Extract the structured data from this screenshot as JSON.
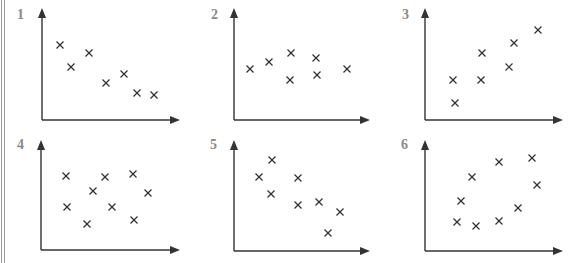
{
  "figure": {
    "axis_color": "#333333",
    "marker_color": "#333333",
    "label_color": "#8a8a8a",
    "border_color": "#9a9a9a"
  },
  "panels": [
    {
      "label": "1",
      "label_pos": [
        17,
        20
      ],
      "origin": [
        42,
        120
      ],
      "x_end": 180,
      "y_top": 8,
      "points": [
        [
          60,
          45
        ],
        [
          71,
          67
        ],
        [
          89,
          53
        ],
        [
          106,
          83
        ],
        [
          124,
          74
        ],
        [
          137,
          93
        ],
        [
          154,
          95
        ]
      ]
    },
    {
      "label": "2",
      "label_pos": [
        211,
        20
      ],
      "origin": [
        234,
        120
      ],
      "x_end": 370,
      "y_top": 8,
      "points": [
        [
          250,
          69
        ],
        [
          269,
          62
        ],
        [
          291,
          53
        ],
        [
          290,
          80
        ],
        [
          316,
          58
        ],
        [
          317,
          75
        ],
        [
          347,
          69
        ]
      ]
    },
    {
      "label": "3",
      "label_pos": [
        402,
        20
      ],
      "origin": [
        425,
        120
      ],
      "x_end": 563,
      "y_top": 8,
      "points": [
        [
          453,
          80
        ],
        [
          455,
          103
        ],
        [
          482,
          53
        ],
        [
          481,
          80
        ],
        [
          509,
          67
        ],
        [
          514,
          43
        ],
        [
          538,
          30
        ]
      ]
    },
    {
      "label": "4",
      "label_pos": [
        17,
        150
      ],
      "origin": [
        41,
        250
      ],
      "x_end": 180,
      "y_top": 140,
      "points": [
        [
          66,
          176
        ],
        [
          105,
          177
        ],
        [
          133,
          174
        ],
        [
          93,
          191
        ],
        [
          148,
          193
        ],
        [
          67,
          207
        ],
        [
          112,
          207
        ],
        [
          87,
          224
        ],
        [
          134,
          220
        ]
      ]
    },
    {
      "label": "5",
      "label_pos": [
        210,
        150
      ],
      "origin": [
        234,
        251
      ],
      "x_end": 370,
      "y_top": 140,
      "points": [
        [
          272,
          160
        ],
        [
          259,
          177
        ],
        [
          271,
          194
        ],
        [
          298,
          178
        ],
        [
          298,
          205
        ],
        [
          319,
          202
        ],
        [
          340,
          212
        ],
        [
          328,
          233
        ]
      ]
    },
    {
      "label": "6",
      "label_pos": [
        401,
        150
      ],
      "origin": [
        425,
        251
      ],
      "x_end": 563,
      "y_top": 140,
      "points": [
        [
          499,
          162
        ],
        [
          532,
          158
        ],
        [
          472,
          177
        ],
        [
          537,
          185
        ],
        [
          461,
          201
        ],
        [
          518,
          208
        ],
        [
          457,
          222
        ],
        [
          476,
          226
        ],
        [
          499,
          221
        ]
      ]
    }
  ],
  "chart_data": [
    {
      "type": "scatter",
      "title": "1",
      "trend": "negative",
      "marker": "x",
      "x": [
        1.0,
        1.6,
        2.6,
        3.5,
        4.6,
        5.3,
        6.2
      ],
      "y": [
        4.1,
        2.9,
        3.7,
        2.0,
        2.5,
        1.5,
        1.4
      ]
    },
    {
      "type": "scatter",
      "title": "2",
      "trend": "none",
      "marker": "x",
      "x": [
        0.9,
        1.9,
        3.1,
        3.0,
        4.4,
        4.4,
        6.1
      ],
      "y": [
        2.8,
        3.2,
        3.7,
        2.2,
        3.4,
        2.5,
        2.8
      ]
    },
    {
      "type": "scatter",
      "title": "3",
      "trend": "positive",
      "marker": "x",
      "x": [
        1.5,
        1.6,
        3.1,
        3.1,
        4.6,
        4.9,
        6.2
      ],
      "y": [
        2.2,
        1.0,
        3.7,
        2.2,
        2.9,
        4.2,
        5.0
      ]
    },
    {
      "type": "scatter",
      "title": "4",
      "trend": "none",
      "marker": "x",
      "x": [
        1.4,
        3.5,
        5.0,
        2.8,
        5.8,
        1.4,
        3.9,
        2.5,
        5.1
      ],
      "y": [
        4.0,
        4.0,
        4.1,
        3.2,
        3.1,
        2.4,
        2.4,
        1.4,
        1.7
      ]
    },
    {
      "type": "scatter",
      "title": "5",
      "trend": "negative",
      "marker": "x",
      "x": [
        2.1,
        1.4,
        2.0,
        3.5,
        3.5,
        4.7,
        5.8,
        5.2
      ],
      "y": [
        5.0,
        4.1,
        3.1,
        4.0,
        2.6,
        2.7,
        2.2,
        1.0
      ]
    },
    {
      "type": "scatter",
      "title": "6",
      "trend": "weak positive",
      "marker": "x",
      "x": [
        4.0,
        5.8,
        2.6,
        6.1,
        2.0,
        5.1,
        1.8,
        2.8,
        4.0
      ],
      "y": [
        4.8,
        5.0,
        4.0,
        3.6,
        2.7,
        2.3,
        1.6,
        1.4,
        1.6
      ]
    }
  ]
}
